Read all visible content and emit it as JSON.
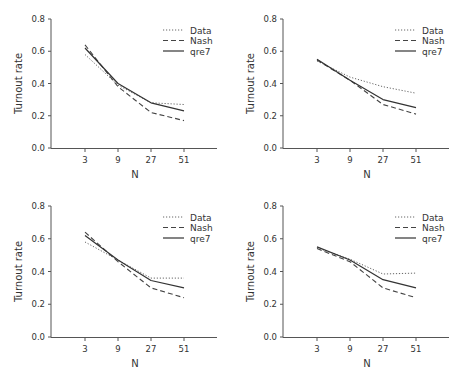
{
  "figure": {
    "layout": "2x2",
    "line_color": "#333333"
  },
  "chart_data": [
    {
      "type": "line",
      "panel": "top-left",
      "title": "",
      "xlabel": "N",
      "ylabel": "Turnout rate",
      "categories": [
        "3",
        "9",
        "27",
        "51"
      ],
      "yticks": [
        "0.0",
        "0.2",
        "0.4",
        "0.6",
        "0.8"
      ],
      "ylim": [
        0,
        0.8
      ],
      "grid": false,
      "legend_position": "upper right",
      "series": [
        {
          "name": "Data",
          "style": "dotted",
          "values": [
            0.58,
            0.39,
            0.28,
            0.27
          ]
        },
        {
          "name": "Nash",
          "style": "dashed",
          "values": [
            0.64,
            0.38,
            0.22,
            0.17
          ]
        },
        {
          "name": "qre7",
          "style": "solid",
          "values": [
            0.62,
            0.4,
            0.28,
            0.23
          ]
        }
      ]
    },
    {
      "type": "line",
      "panel": "top-right",
      "title": "",
      "xlabel": "N",
      "ylabel": "Turnout rate",
      "categories": [
        "3",
        "9",
        "27",
        "51"
      ],
      "yticks": [
        "0.0",
        "0.2",
        "0.4",
        "0.6",
        "0.8"
      ],
      "ylim": [
        0,
        0.8
      ],
      "grid": false,
      "legend_position": "upper right",
      "series": [
        {
          "name": "Data",
          "style": "dotted",
          "values": [
            0.54,
            0.44,
            0.38,
            0.34
          ]
        },
        {
          "name": "Nash",
          "style": "dashed",
          "values": [
            0.545,
            0.42,
            0.27,
            0.21
          ]
        },
        {
          "name": "qre7",
          "style": "solid",
          "values": [
            0.55,
            0.42,
            0.3,
            0.25
          ]
        }
      ]
    },
    {
      "type": "line",
      "panel": "bottom-left",
      "title": "",
      "xlabel": "N",
      "ylabel": "Turnout rate",
      "categories": [
        "3",
        "9",
        "27",
        "51"
      ],
      "yticks": [
        "0.0",
        "0.2",
        "0.4",
        "0.6",
        "0.8"
      ],
      "ylim": [
        0,
        0.8
      ],
      "grid": false,
      "legend_position": "upper right",
      "series": [
        {
          "name": "Data",
          "style": "dotted",
          "values": [
            0.58,
            0.47,
            0.36,
            0.36
          ]
        },
        {
          "name": "Nash",
          "style": "dashed",
          "values": [
            0.64,
            0.46,
            0.3,
            0.24
          ]
        },
        {
          "name": "qre7",
          "style": "solid",
          "values": [
            0.62,
            0.47,
            0.345,
            0.3
          ]
        }
      ]
    },
    {
      "type": "line",
      "panel": "bottom-right",
      "title": "",
      "xlabel": "N",
      "ylabel": "Turnout rate",
      "categories": [
        "3",
        "9",
        "27",
        "51"
      ],
      "yticks": [
        "0.0",
        "0.2",
        "0.4",
        "0.6",
        "0.8"
      ],
      "ylim": [
        0,
        0.8
      ],
      "grid": false,
      "legend_position": "upper right",
      "series": [
        {
          "name": "Data",
          "style": "dotted",
          "values": [
            0.545,
            0.475,
            0.385,
            0.39
          ]
        },
        {
          "name": "Nash",
          "style": "dashed",
          "values": [
            0.54,
            0.46,
            0.3,
            0.24
          ]
        },
        {
          "name": "qre7",
          "style": "solid",
          "values": [
            0.55,
            0.47,
            0.35,
            0.3
          ]
        }
      ]
    }
  ]
}
